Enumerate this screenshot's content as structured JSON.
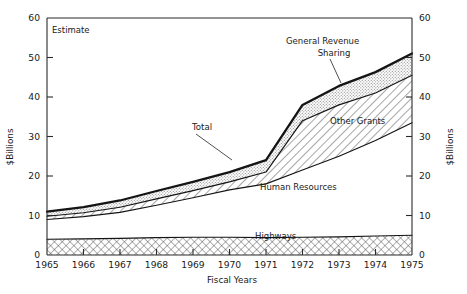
{
  "chart_data": {
    "type": "area",
    "title": "",
    "subtitle": "",
    "xlabel": "Fiscal Years",
    "ylabel": "$Billions",
    "ylabel_right": "$Billions",
    "x": [
      1965,
      1966,
      1967,
      1968,
      1969,
      1970,
      1971,
      1972,
      1973,
      1974,
      1975
    ],
    "categories": [
      "1965",
      "1966",
      "1967",
      "1968",
      "1969",
      "1970",
      "1971",
      "1972",
      "1973",
      "1974",
      "1975"
    ],
    "xlim": [
      1965,
      1975
    ],
    "ylim": [
      0,
      60
    ],
    "yticks": [
      0,
      10,
      20,
      30,
      40,
      50,
      60
    ],
    "yticks_right": [
      0,
      10,
      20,
      30,
      40,
      50,
      60
    ],
    "grid": false,
    "legend": "inline-annotations",
    "stacked": true,
    "stack_order_bottom_to_top": [
      "Highways",
      "Human Resources",
      "Other Grants",
      "General Revenue Sharing"
    ],
    "series": [
      {
        "name": "Highways",
        "fill": "cross-hatch",
        "values": [
          4.0,
          4.1,
          4.2,
          4.4,
          4.5,
          4.5,
          4.4,
          4.5,
          4.6,
          4.8,
          5.0
        ]
      },
      {
        "name": "Human Resources",
        "fill": "white",
        "values": [
          5.0,
          5.6,
          6.6,
          8.2,
          10.0,
          12.0,
          13.6,
          17.0,
          20.4,
          24.2,
          28.5
        ]
      },
      {
        "name": "Other Grants",
        "fill": "diagonal-hatch",
        "values": [
          0.8,
          1.0,
          1.3,
          1.6,
          1.8,
          2.0,
          3.0,
          12.5,
          13.0,
          12.0,
          12.0
        ]
      },
      {
        "name": "General Revenue Sharing",
        "fill": "stipple",
        "values": [
          1.2,
          1.4,
          1.7,
          2.0,
          2.2,
          2.5,
          3.0,
          4.0,
          4.8,
          5.3,
          5.5
        ]
      }
    ],
    "cumulative_boundaries": [
      {
        "name": "Highways top",
        "values": [
          4.0,
          4.1,
          4.2,
          4.4,
          4.5,
          4.5,
          4.4,
          4.5,
          4.6,
          4.8,
          5.0
        ]
      },
      {
        "name": "Human Resources top",
        "values": [
          9.0,
          9.7,
          10.8,
          12.6,
          14.5,
          16.5,
          18.0,
          21.5,
          25.0,
          29.0,
          33.5
        ]
      },
      {
        "name": "Other Grants top",
        "values": [
          9.8,
          10.7,
          12.1,
          14.2,
          16.3,
          18.5,
          21.0,
          34.0,
          38.0,
          41.0,
          45.5
        ]
      },
      {
        "name": "Total",
        "values": [
          11.0,
          12.1,
          13.8,
          16.2,
          18.5,
          21.0,
          24.0,
          38.0,
          42.8,
          46.3,
          51.0
        ]
      }
    ],
    "annotations": [
      {
        "id": "estimate",
        "text": "Estimate",
        "x_px": 52,
        "y_px": 30
      },
      {
        "id": "total",
        "text": "Total",
        "x_px": 192,
        "y_px": 128
      },
      {
        "id": "general-revenue-sharing-l1",
        "text": "General Revenue",
        "x_px": 286,
        "y_px": 42
      },
      {
        "id": "general-revenue-sharing-l2",
        "text": "Sharing",
        "x_px": 321,
        "y_px": 54
      },
      {
        "id": "other-grants",
        "text": "Other Grants",
        "x_px": 330,
        "y_px": 121
      },
      {
        "id": "human-resources",
        "text": "Human Resources",
        "x_px": 260,
        "y_px": 187
      },
      {
        "id": "highways",
        "text": "Highways",
        "x_px": 255,
        "y_px": 236
      }
    ]
  },
  "axes": {
    "left_title": "$Billions",
    "right_title": "$Billions",
    "bottom_title": "Fiscal Years",
    "y_ticks": [
      "0",
      "10",
      "20",
      "30",
      "40",
      "50",
      "60"
    ],
    "y_ticks_right": [
      "0",
      "10",
      "20",
      "30",
      "40",
      "50",
      "60"
    ],
    "x_ticks": [
      "1965",
      "1966",
      "1967",
      "1968",
      "1969",
      "1970",
      "1971",
      "1972",
      "1973",
      "1974",
      "1975"
    ]
  },
  "labels": {
    "estimate": "Estimate",
    "total": "Total",
    "grs_line1": "General Revenue",
    "grs_line2": "Sharing",
    "other_grants": "Other Grants",
    "human_resources": "Human Resources",
    "highways": "Highways"
  },
  "colors": {
    "ink": "#141414",
    "axis": "#2b2b2b",
    "hatch": "#3a3a3a",
    "stipple": "#9a9a9a",
    "background": "#ffffff"
  }
}
